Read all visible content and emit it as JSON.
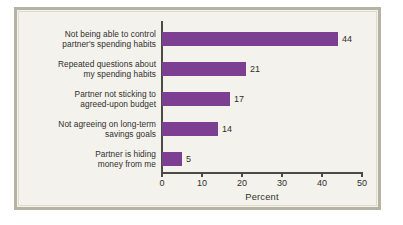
{
  "chart_data": {
    "type": "bar",
    "orientation": "horizontal",
    "title": "",
    "xlabel": "Percent",
    "ylabel": "",
    "xlim": [
      0,
      50
    ],
    "xticks": [
      0,
      10,
      20,
      30,
      40,
      50
    ],
    "xtick_labels": [
      "0",
      "10",
      "20",
      "30",
      "40",
      "50"
    ],
    "grid": false,
    "legend": null,
    "bar_color": "#7d3f92",
    "categories": [
      "Not being able to control partner's spending habits",
      "Repeated questions about my spending habits",
      "Partner not sticking to agreed-upon budget",
      "Not agreeing on long-term savings goals",
      "Partner is hiding money from me"
    ],
    "category_lines": [
      [
        "Not being able to control",
        "partner's spending habits"
      ],
      [
        "Repeated questions about",
        "my spending habits"
      ],
      [
        "Partner not sticking to",
        "agreed-upon budget"
      ],
      [
        "Not agreeing on long-term",
        "savings goals"
      ],
      [
        "Partner is hiding",
        "money from me"
      ]
    ],
    "values": [
      44,
      21,
      17,
      14,
      5
    ],
    "value_labels": [
      "44",
      "21",
      "17",
      "14",
      "5"
    ]
  },
  "style": {
    "frame_border_color": "#b5b3a4",
    "plot_background": "#f4f2ec",
    "axis_color": "#4a4a46",
    "text_color": "#2f2f2d"
  }
}
